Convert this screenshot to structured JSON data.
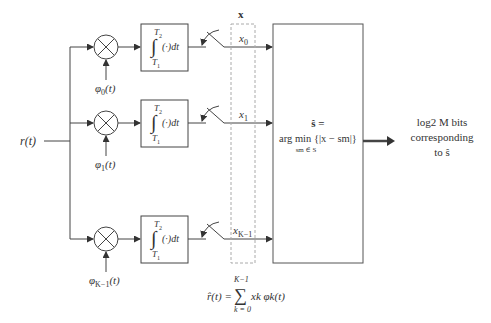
{
  "diagram": {
    "input": {
      "label": "r(t)"
    },
    "vector_label": "x",
    "branches": [
      {
        "index": 0,
        "basis": "φ0(t)",
        "basis_base": "φ",
        "basis_sub": "0",
        "basis_arg": "(t)",
        "output": "x0",
        "output_base": "x",
        "output_sub": "0"
      },
      {
        "index": 1,
        "basis": "φ1(t)",
        "basis_base": "φ",
        "basis_sub": "1",
        "basis_arg": "(t)",
        "output": "x1",
        "output_base": "x",
        "output_sub": "1"
      },
      {
        "index": 2,
        "basis": "φK−1(t)",
        "basis_base": "φ",
        "basis_sub": "K−1",
        "basis_arg": "(t)",
        "output": "xK−1",
        "output_base": "x",
        "output_sub": "K−1"
      }
    ],
    "integrator": {
      "upper": "T2",
      "upper_base": "T",
      "upper_sub": "2",
      "lower": "T1",
      "lower_base": "T",
      "lower_sub": "1",
      "integrand": "(·)dt"
    },
    "decision": {
      "line1": "ŝ =",
      "line2": "arg min {|x − sm|}",
      "subscript": "sm ∈ S"
    },
    "output": {
      "line1": "log2 M bits",
      "line2": "corresponding",
      "line3": "to ŝ"
    },
    "reconstruction": {
      "lhs": "r̂(t) =",
      "sum_upper": "K−1",
      "sum_lower": "k = 0",
      "term": "xk φk(t)"
    },
    "colors": {
      "line": "#333333",
      "dashed": "#aaaaaa",
      "background": "#ffffff"
    }
  }
}
